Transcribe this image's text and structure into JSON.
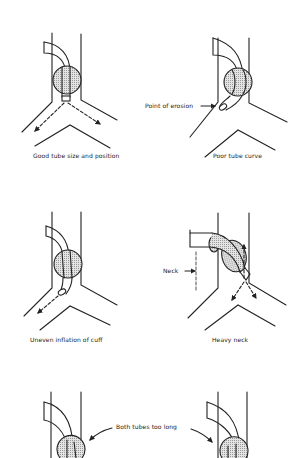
{
  "panels": [
    {
      "id": "good",
      "caption": "Good tube size and position"
    },
    {
      "id": "poor-curve",
      "caption": "Poor tube curve",
      "callout": "Point of erosion"
    },
    {
      "id": "uneven",
      "caption": "Uneven inflation of cuff"
    },
    {
      "id": "heavy-neck",
      "caption": "Heavy neck",
      "callout": "Neck"
    },
    {
      "id": "too-long-left",
      "caption": ""
    },
    {
      "id": "too-long-right",
      "caption": ""
    }
  ],
  "shared_callout": "Both tubes too long",
  "colors": {
    "ink": "#222222",
    "cuff_fill": "#cfcfcf",
    "background": "#ffffff"
  }
}
